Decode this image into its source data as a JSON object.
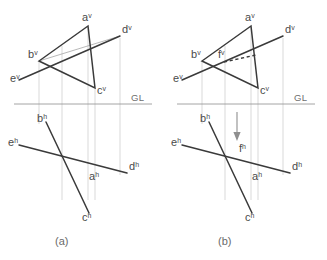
{
  "figure": {
    "captions": [
      {
        "id": "caption-a",
        "text": "(a)",
        "x": 55,
        "y": 245
      },
      {
        "id": "caption-b",
        "text": "(b)",
        "x": 218,
        "y": 245
      }
    ],
    "ground_line_label": "GL",
    "stroke_colors": {
      "solid": "#3a3a3a",
      "thin": "#9a9a9a",
      "ground_line": "#9a9a9a",
      "projector": "#c9c9c9",
      "dashed": "#3a3a3a",
      "arrow": "#8f8f8f",
      "label_text": "#4a4a4a",
      "caption_text": "#6a6a6a",
      "background": "#ffffff"
    }
  },
  "panel_a": {
    "name": "figure-a",
    "ground_line": {
      "x1": 14,
      "y1": 104,
      "x2": 152,
      "y2": 104,
      "label": "GL",
      "label_x": 131,
      "label_y": 101
    },
    "vertical_view": {
      "points": {
        "a": {
          "x": 88,
          "y": 26,
          "label": "a",
          "sup": "v",
          "lx": 82,
          "ly": 21
        },
        "b": {
          "x": 39,
          "y": 61,
          "label": "b",
          "sup": "v",
          "lx": 28,
          "ly": 58
        },
        "c": {
          "x": 95,
          "y": 88,
          "label": "c",
          "sup": "v",
          "lx": 97,
          "ly": 94
        },
        "d": {
          "x": 120,
          "y": 36,
          "label": "d",
          "sup": "v",
          "lx": 122,
          "ly": 33
        },
        "e": {
          "x": 19,
          "y": 80,
          "label": "e",
          "sup": "v",
          "lx": 10,
          "ly": 82
        }
      },
      "triangle_edges": [
        [
          "a",
          "b"
        ],
        [
          "b",
          "c"
        ],
        [
          "c",
          "a"
        ]
      ],
      "line_ed": [
        "e",
        "d"
      ],
      "thin_segment": [
        "b",
        "d"
      ]
    },
    "horizontal_view": {
      "points": {
        "b": {
          "x": 46,
          "y": 122,
          "label": "b",
          "sup": "h",
          "lx": 37,
          "ly": 122
        },
        "c": {
          "x": 89,
          "y": 213,
          "label": "c",
          "sup": "h",
          "lx": 82,
          "ly": 221
        },
        "e": {
          "x": 19,
          "y": 145,
          "label": "e",
          "sup": "h",
          "lx": 8,
          "ly": 146
        },
        "d": {
          "x": 127,
          "y": 173,
          "label": "d",
          "sup": "h",
          "lx": 129,
          "ly": 170
        },
        "a": {
          "x": 83,
          "y": 178,
          "label": "a",
          "sup": "h",
          "lx": 89,
          "ly": 180
        }
      },
      "line_bc": [
        "b",
        "c"
      ],
      "line_ed": [
        "e",
        "d"
      ]
    },
    "projectors": [
      {
        "x": 39,
        "y1": 62,
        "y2": 124
      },
      {
        "x": 62,
        "y1": 46,
        "y2": 200
      },
      {
        "x": 88,
        "y1": 28,
        "y2": 200
      },
      {
        "x": 95,
        "y1": 89,
        "y2": 200
      },
      {
        "x": 120,
        "y1": 38,
        "y2": 175
      }
    ]
  },
  "panel_b": {
    "name": "figure-b",
    "ground_line": {
      "x1": 177,
      "y1": 104,
      "x2": 315,
      "y2": 104,
      "label": "GL",
      "label_x": 294,
      "label_y": 101
    },
    "vertical_view": {
      "points": {
        "a": {
          "x": 251,
          "y": 26,
          "label": "a",
          "sup": "v",
          "lx": 245,
          "ly": 21
        },
        "b": {
          "x": 202,
          "y": 61,
          "label": "b",
          "sup": "v",
          "lx": 191,
          "ly": 58
        },
        "c": {
          "x": 258,
          "y": 88,
          "label": "c",
          "sup": "v",
          "lx": 260,
          "ly": 94
        },
        "d": {
          "x": 283,
          "y": 36,
          "label": "d",
          "sup": "v",
          "lx": 285,
          "ly": 33
        },
        "e": {
          "x": 182,
          "y": 80,
          "label": "e",
          "sup": "v",
          "lx": 173,
          "ly": 82
        },
        "f": {
          "x": 222,
          "y": 62,
          "label": "f",
          "sup": "v",
          "lx": 218,
          "ly": 58
        }
      },
      "triangle_edges": [
        [
          "a",
          "b"
        ],
        [
          "b",
          "c"
        ],
        [
          "c",
          "a"
        ]
      ],
      "line_ed": [
        "e",
        "d"
      ],
      "dashed_segment": {
        "x1": 224,
        "y1": 62,
        "x2": 256,
        "y2": 55
      }
    },
    "horizontal_view": {
      "points": {
        "b": {
          "x": 209,
          "y": 122,
          "label": "b",
          "sup": "h",
          "lx": 200,
          "ly": 122
        },
        "c": {
          "x": 252,
          "y": 213,
          "label": "c",
          "sup": "h",
          "lx": 245,
          "ly": 221
        },
        "e": {
          "x": 182,
          "y": 145,
          "label": "e",
          "sup": "h",
          "lx": 171,
          "ly": 146
        },
        "d": {
          "x": 290,
          "y": 173,
          "label": "d",
          "sup": "h",
          "lx": 292,
          "ly": 170
        },
        "a": {
          "x": 246,
          "y": 178,
          "label": "a",
          "sup": "h",
          "lx": 252,
          "ly": 180
        },
        "f": {
          "x": 237,
          "y": 157,
          "label": "f",
          "sup": "h",
          "lx": 239,
          "ly": 152
        }
      },
      "line_bc": [
        "b",
        "c"
      ],
      "line_ed": [
        "e",
        "d"
      ]
    },
    "projectors": [
      {
        "x": 202,
        "y1": 62,
        "y2": 124
      },
      {
        "x": 225,
        "y1": 46,
        "y2": 200
      },
      {
        "x": 251,
        "y1": 28,
        "y2": 200
      },
      {
        "x": 258,
        "y1": 89,
        "y2": 200
      },
      {
        "x": 283,
        "y1": 38,
        "y2": 175
      }
    ],
    "transfer_arrow": {
      "x": 237,
      "y1": 112,
      "y2": 140,
      "head_w": 4,
      "head_h": 6
    }
  }
}
